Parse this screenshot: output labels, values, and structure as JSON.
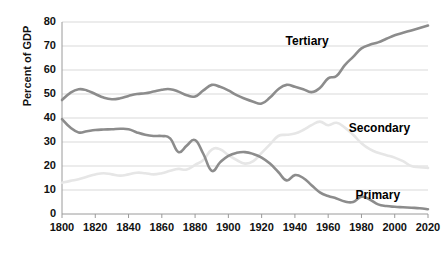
{
  "chart_data": {
    "type": "line",
    "title": "",
    "subtitle": "",
    "xlabel": "",
    "ylabel": "Percent of GDP",
    "xlim": [
      1800,
      2020
    ],
    "ylim": [
      0,
      80
    ],
    "ytick_step": 10,
    "xtick_step": 20,
    "grid": true,
    "legend_position": "inline-annotations",
    "xticks": [
      1800,
      1820,
      1840,
      1860,
      1880,
      1900,
      1920,
      1940,
      1960,
      1980,
      2000,
      2020
    ],
    "yticks": [
      0,
      10,
      20,
      30,
      40,
      50,
      60,
      70,
      80
    ],
    "annotations": [
      {
        "text": "Tertiary",
        "x": 1950,
        "y": 71.5
      },
      {
        "text": "Secondary",
        "x": 1988,
        "y": 35.5
      },
      {
        "text": "Primary",
        "x": 1992,
        "y": 7.5
      }
    ],
    "series": [
      {
        "name": "Tertiary",
        "color": "#8c8c8c",
        "x": [
          1800,
          1805,
          1810,
          1815,
          1820,
          1825,
          1830,
          1835,
          1840,
          1845,
          1850,
          1855,
          1860,
          1865,
          1870,
          1875,
          1880,
          1885,
          1890,
          1895,
          1900,
          1905,
          1910,
          1915,
          1920,
          1925,
          1930,
          1935,
          1940,
          1945,
          1950,
          1955,
          1960,
          1965,
          1970,
          1975,
          1980,
          1985,
          1990,
          1995,
          2000,
          2005,
          2010,
          2015,
          2020
        ],
        "values": [
          47.5,
          50.5,
          52.0,
          51.5,
          50.0,
          48.5,
          47.8,
          48.2,
          49.2,
          50.0,
          50.3,
          51.0,
          51.8,
          52.0,
          51.0,
          49.5,
          49.0,
          51.5,
          53.8,
          53.0,
          51.5,
          49.5,
          48.0,
          46.8,
          46.0,
          48.5,
          52.0,
          53.8,
          53.0,
          52.0,
          50.8,
          52.5,
          56.5,
          57.5,
          62.0,
          65.5,
          69.0,
          70.5,
          71.5,
          73.0,
          74.5,
          75.5,
          76.5,
          77.5,
          78.5
        ]
      },
      {
        "name": "Secondary",
        "color": "#e6e6e6",
        "x": [
          1800,
          1805,
          1810,
          1815,
          1820,
          1825,
          1830,
          1835,
          1840,
          1845,
          1850,
          1855,
          1860,
          1865,
          1870,
          1875,
          1880,
          1885,
          1890,
          1895,
          1900,
          1905,
          1910,
          1915,
          1920,
          1925,
          1930,
          1935,
          1940,
          1945,
          1950,
          1955,
          1960,
          1965,
          1970,
          1975,
          1980,
          1985,
          1990,
          1995,
          2000,
          2005,
          2010,
          2015,
          2020
        ],
        "values": [
          13.0,
          13.8,
          14.5,
          15.5,
          16.5,
          17.0,
          16.5,
          16.0,
          16.5,
          17.2,
          17.0,
          16.5,
          17.0,
          18.0,
          18.8,
          18.5,
          20.5,
          22.5,
          26.8,
          27.0,
          24.5,
          22.5,
          21.0,
          22.0,
          25.5,
          29.0,
          32.5,
          33.0,
          33.5,
          35.0,
          37.0,
          38.5,
          37.0,
          38.0,
          36.0,
          33.0,
          29.5,
          27.0,
          25.5,
          24.5,
          23.5,
          22.0,
          20.0,
          19.5,
          19.2
        ]
      },
      {
        "name": "Primary",
        "color": "#8c8c8c",
        "x": [
          1800,
          1805,
          1810,
          1815,
          1820,
          1825,
          1830,
          1835,
          1840,
          1845,
          1850,
          1855,
          1860,
          1865,
          1870,
          1875,
          1880,
          1885,
          1890,
          1895,
          1900,
          1905,
          1910,
          1915,
          1920,
          1925,
          1930,
          1935,
          1940,
          1945,
          1950,
          1955,
          1960,
          1965,
          1970,
          1975,
          1980,
          1985,
          1990,
          1995,
          2000,
          2005,
          2010,
          2015,
          2020
        ],
        "values": [
          39.5,
          36.0,
          34.0,
          34.5,
          35.0,
          35.2,
          35.3,
          35.5,
          35.3,
          34.0,
          33.0,
          32.5,
          32.5,
          31.5,
          25.8,
          28.5,
          30.8,
          25.0,
          18.0,
          21.5,
          24.2,
          25.5,
          25.8,
          25.0,
          23.5,
          21.0,
          17.5,
          14.0,
          16.2,
          15.0,
          12.0,
          9.0,
          7.5,
          6.5,
          5.2,
          5.0,
          7.2,
          6.0,
          4.0,
          3.3,
          3.0,
          2.8,
          2.6,
          2.4,
          2.0
        ]
      }
    ]
  },
  "axis": {
    "y_title": "Percent of GDP"
  }
}
